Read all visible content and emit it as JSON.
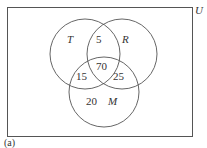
{
  "diagram": {
    "type": "venn",
    "universe_label": "U",
    "caption": "(a)",
    "sets": [
      {
        "name": "T",
        "cx": 85,
        "cy": 54,
        "r": 35
      },
      {
        "name": "R",
        "cx": 122,
        "cy": 54,
        "r": 35
      },
      {
        "name": "M",
        "cx": 104,
        "cy": 92,
        "r": 35
      }
    ],
    "regions": {
      "T_and_R_only": "5",
      "T_and_R_and_M": "70",
      "T_and_M_only": "15",
      "R_and_M_only": "25",
      "M_only": "20"
    },
    "colors": {
      "stroke": "#555555",
      "text": "#333333"
    }
  }
}
